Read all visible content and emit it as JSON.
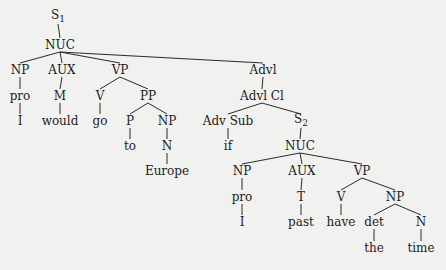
{
  "diagram": {
    "type": "syntax-tree",
    "nodes": [
      {
        "id": "s1",
        "label": "S",
        "sub": "1",
        "x": 58,
        "y": 17
      },
      {
        "id": "nuc1",
        "label": "NUC",
        "x": 60,
        "y": 45
      },
      {
        "id": "np1",
        "label": "NP",
        "x": 20,
        "y": 70
      },
      {
        "id": "aux1",
        "label": "AUX",
        "x": 62,
        "y": 70
      },
      {
        "id": "vp1",
        "label": "VP",
        "x": 120,
        "y": 70
      },
      {
        "id": "pro1",
        "label": "pro",
        "x": 20,
        "y": 96
      },
      {
        "id": "m1",
        "label": "M",
        "x": 60,
        "y": 96
      },
      {
        "id": "v1",
        "label": "V",
        "x": 100,
        "y": 96
      },
      {
        "id": "pp1",
        "label": "PP",
        "x": 148,
        "y": 96
      },
      {
        "id": "i1",
        "label": "I",
        "x": 20,
        "y": 121
      },
      {
        "id": "would",
        "label": "would",
        "x": 60,
        "y": 121
      },
      {
        "id": "go",
        "label": "go",
        "x": 100,
        "y": 121
      },
      {
        "id": "p1",
        "label": "P",
        "x": 130,
        "y": 121
      },
      {
        "id": "np2",
        "label": "NP",
        "x": 167,
        "y": 121
      },
      {
        "id": "to",
        "label": "to",
        "x": 130,
        "y": 146
      },
      {
        "id": "n1",
        "label": "N",
        "x": 167,
        "y": 146
      },
      {
        "id": "europe",
        "label": "Europe",
        "x": 167,
        "y": 171
      },
      {
        "id": "advl",
        "label": "Advl",
        "x": 263,
        "y": 70
      },
      {
        "id": "advlcl",
        "label": "Advl Cl",
        "x": 262,
        "y": 96
      },
      {
        "id": "advsub",
        "label": "Adv Sub",
        "x": 228,
        "y": 121
      },
      {
        "id": "s2",
        "label": "S",
        "sub": "2",
        "x": 301,
        "y": 121
      },
      {
        "id": "if",
        "label": "if",
        "x": 228,
        "y": 146
      },
      {
        "id": "nuc2",
        "label": "NUC",
        "x": 300,
        "y": 146
      },
      {
        "id": "np3",
        "label": "NP",
        "x": 242,
        "y": 171
      },
      {
        "id": "aux2",
        "label": "AUX",
        "x": 302,
        "y": 171
      },
      {
        "id": "vp2",
        "label": "VP",
        "x": 362,
        "y": 171
      },
      {
        "id": "pro2",
        "label": "pro",
        "x": 242,
        "y": 197
      },
      {
        "id": "t",
        "label": "T",
        "x": 301,
        "y": 197
      },
      {
        "id": "v2",
        "label": "V",
        "x": 341,
        "y": 197
      },
      {
        "id": "np4",
        "label": "NP",
        "x": 395,
        "y": 197
      },
      {
        "id": "i2",
        "label": "I",
        "x": 242,
        "y": 222
      },
      {
        "id": "past",
        "label": "past",
        "x": 301,
        "y": 222
      },
      {
        "id": "have",
        "label": "have",
        "x": 341,
        "y": 222
      },
      {
        "id": "det",
        "label": "det",
        "x": 374,
        "y": 222
      },
      {
        "id": "n2",
        "label": "N",
        "x": 421,
        "y": 222
      },
      {
        "id": "the",
        "label": "the",
        "x": 374,
        "y": 248
      },
      {
        "id": "time",
        "label": "time",
        "x": 421,
        "y": 248
      }
    ],
    "edges": [
      [
        "s1",
        "nuc1"
      ],
      [
        "nuc1",
        "np1"
      ],
      [
        "nuc1",
        "aux1"
      ],
      [
        "nuc1",
        "vp1"
      ],
      [
        "nuc1",
        "advl"
      ],
      [
        "np1",
        "pro1"
      ],
      [
        "pro1",
        "i1"
      ],
      [
        "aux1",
        "m1"
      ],
      [
        "m1",
        "would"
      ],
      [
        "vp1",
        "v1"
      ],
      [
        "vp1",
        "pp1"
      ],
      [
        "v1",
        "go"
      ],
      [
        "pp1",
        "p1"
      ],
      [
        "pp1",
        "np2"
      ],
      [
        "p1",
        "to"
      ],
      [
        "np2",
        "n1"
      ],
      [
        "n1",
        "europe"
      ],
      [
        "advl",
        "advlcl"
      ],
      [
        "advlcl",
        "advsub"
      ],
      [
        "advlcl",
        "s2"
      ],
      [
        "advsub",
        "if"
      ],
      [
        "s2",
        "nuc2"
      ],
      [
        "nuc2",
        "np3"
      ],
      [
        "nuc2",
        "aux2"
      ],
      [
        "nuc2",
        "vp2"
      ],
      [
        "np3",
        "pro2"
      ],
      [
        "pro2",
        "i2"
      ],
      [
        "aux2",
        "t"
      ],
      [
        "t",
        "past"
      ],
      [
        "vp2",
        "v2"
      ],
      [
        "vp2",
        "np4"
      ],
      [
        "v2",
        "have"
      ],
      [
        "np4",
        "det"
      ],
      [
        "np4",
        "n2"
      ],
      [
        "det",
        "the"
      ],
      [
        "n2",
        "time"
      ]
    ]
  }
}
